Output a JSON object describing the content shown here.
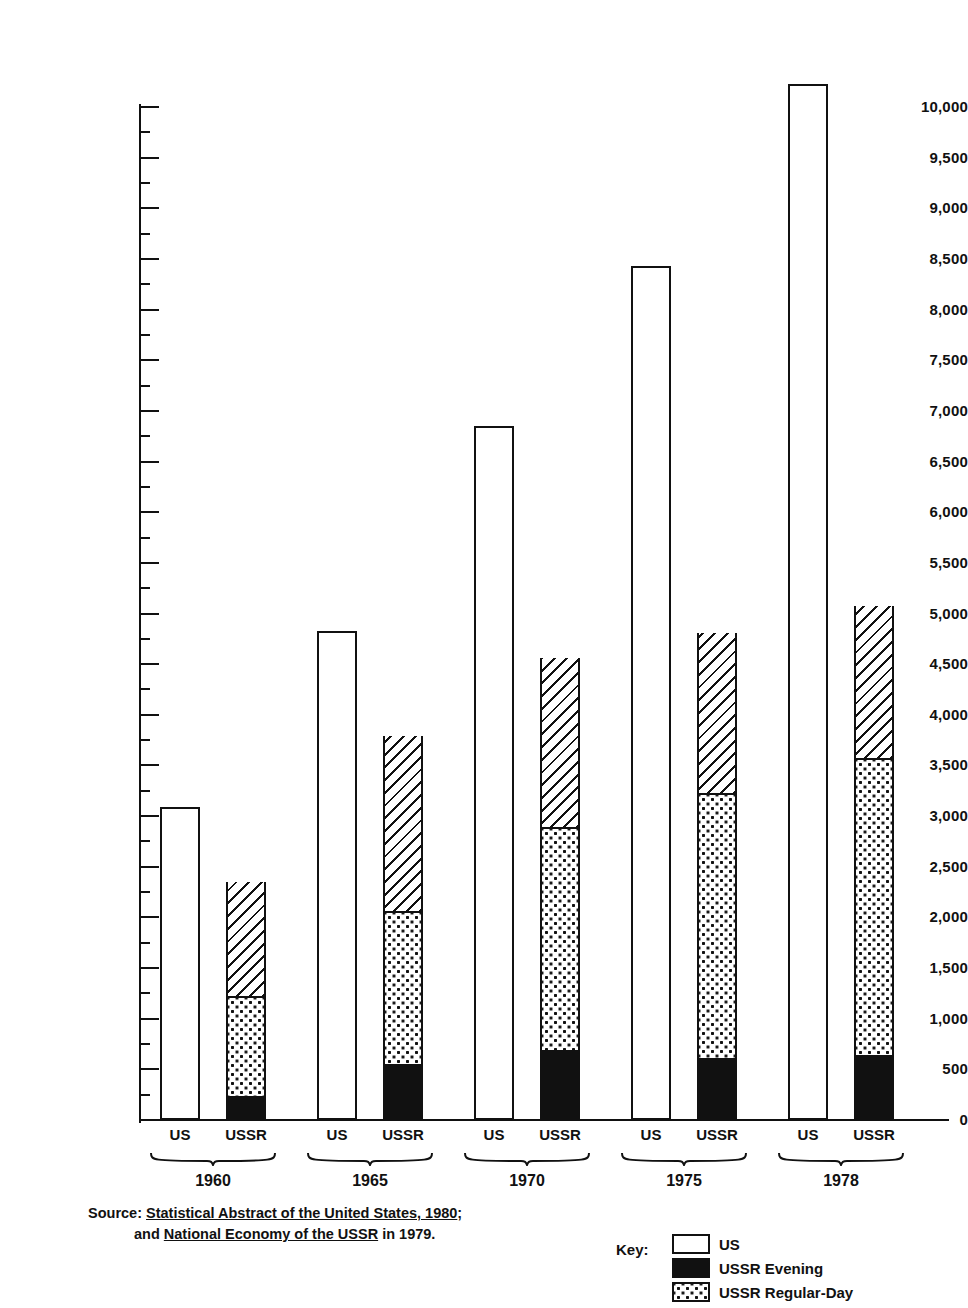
{
  "chart_data": {
    "type": "bar",
    "title": "",
    "subtitle": "",
    "xlabel": "",
    "ylabel": "",
    "ylim": [
      0,
      10000
    ],
    "ytick_step": 500,
    "yticks": [
      0,
      500,
      1000,
      1500,
      2000,
      2500,
      3000,
      3500,
      4000,
      4500,
      5000,
      5500,
      6000,
      6500,
      7000,
      7500,
      8000,
      8500,
      9000,
      9500,
      10000
    ],
    "ytick_labels": [
      "0",
      "500",
      "1,000",
      "1,500",
      "2,000",
      "2,500",
      "3,000",
      "3,500",
      "4,000",
      "4,500",
      "5,000",
      "5,500",
      "6,000",
      "6,500",
      "7,000",
      "7,500",
      "8,000",
      "8,500",
      "9,000",
      "9,500",
      "10,000"
    ],
    "grid": false,
    "legend_position": "bottom-right",
    "categories": [
      "1960",
      "1965",
      "1970",
      "1975",
      "1978"
    ],
    "entity_labels": [
      "US",
      "USSR"
    ],
    "series": [
      {
        "name": "US",
        "pattern": "plain",
        "values": [
          3090,
          4830,
          6855,
          8430,
          10230
        ]
      },
      {
        "name": "USSR Evening",
        "pattern": "dash",
        "values": [
          240,
          555,
          690,
          610,
          640
        ]
      },
      {
        "name": "USSR Regular-Day",
        "pattern": "dots",
        "values": [
          980,
          1510,
          2200,
          2615,
          2930
        ]
      },
      {
        "name": "USSR Other",
        "pattern": "hatch",
        "values": [
          1130,
          1725,
          1670,
          1585,
          1505
        ]
      }
    ],
    "ussr_totals": [
      2350,
      3790,
      4560,
      4810,
      5075
    ],
    "ussr_cumulative_boundaries": [
      {
        "year": "1960",
        "evening_top": 240,
        "regular_top": 1220,
        "bar_top": 2350
      },
      {
        "year": "1965",
        "evening_top": 555,
        "regular_top": 2065,
        "bar_top": 3790
      },
      {
        "year": "1970",
        "evening_top": 690,
        "regular_top": 2890,
        "bar_top": 4560
      },
      {
        "year": "1975",
        "evening_top": 610,
        "regular_top": 3225,
        "bar_top": 4810
      },
      {
        "year": "1978",
        "evening_top": 640,
        "regular_top": 3570,
        "bar_top": 5075
      }
    ]
  },
  "groups": [
    {
      "year": "1960",
      "us": 3090,
      "ussr_total": 2350,
      "evening_top": 240,
      "regular_top": 1220
    },
    {
      "year": "1965",
      "us": 4830,
      "ussr_total": 3790,
      "evening_top": 555,
      "regular_top": 2065
    },
    {
      "year": "1970",
      "us": 6855,
      "ussr_total": 4560,
      "evening_top": 690,
      "regular_top": 2890
    },
    {
      "year": "1975",
      "us": 8430,
      "ussr_total": 4810,
      "evening_top": 610,
      "regular_top": 3225
    },
    {
      "year": "1978",
      "us": 10230,
      "ussr_total": 5075,
      "evening_top": 640,
      "regular_top": 3570
    }
  ],
  "axis_labels": {
    "us": "US",
    "ussr": "USSR"
  },
  "source": {
    "prefix": "Source:",
    "line1_italic": "Statistical Abstract of the United States, 1980",
    "line1_suffix": ";",
    "line2_prefix": "and ",
    "line2_italic": "National Economy of the USSR",
    "line2_suffix": " in 1979."
  },
  "legend": {
    "key_word": "Key:",
    "items": [
      {
        "label": "US",
        "pattern": "plain"
      },
      {
        "label": "USSR Evening",
        "pattern": "dash"
      },
      {
        "label": "USSR Regular-Day",
        "pattern": "dots"
      }
    ]
  },
  "colors": {
    "ink": "#111111",
    "paper": "#ffffff"
  }
}
